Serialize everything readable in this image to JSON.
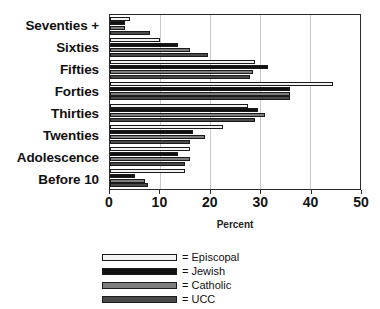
{
  "title_remnant": "",
  "axis": {
    "xlabel": "Percent",
    "ticks": [
      "0",
      "10",
      "20",
      "30",
      "40",
      "50"
    ]
  },
  "legend": {
    "items": [
      {
        "key": "episcopal",
        "label": "= Episcopal"
      },
      {
        "key": "jewish",
        "label": "= Jewish"
      },
      {
        "key": "catholic",
        "label": "= Catholic"
      },
      {
        "key": "ucc",
        "label": "= UCC"
      }
    ]
  },
  "colors": {
    "episcopal": "#f2f2f2",
    "jewish": "#111111",
    "catholic": "#7d7d7d",
    "ucc": "#4a4a4a",
    "axis": "#2b2b2b",
    "grid": "#c9c9c9"
  },
  "categories": [
    "Seventies +",
    "Sixties",
    "Fifties",
    "Forties",
    "Thirties",
    "Twenties",
    "Adolescence",
    "Before 10"
  ],
  "chart_data": {
    "type": "bar",
    "orientation": "horizontal",
    "title": "",
    "xlabel": "Percent",
    "ylabel": "",
    "xlim": [
      0,
      50
    ],
    "xticks": [
      0,
      10,
      20,
      30,
      40,
      50
    ],
    "grid": true,
    "legend_position": "bottom",
    "categories": [
      "Seventies +",
      "Sixties",
      "Fifties",
      "Forties",
      "Thirties",
      "Twenties",
      "Adolescence",
      "Before 10"
    ],
    "series": [
      {
        "name": "Episcopal",
        "color": "#f2f2f2",
        "values": [
          4,
          10,
          29,
          44.5,
          27.5,
          22.5,
          16,
          15
        ]
      },
      {
        "name": "Jewish",
        "color": "#111111",
        "values": [
          3,
          13.5,
          31.5,
          36,
          29.5,
          16.5,
          13.5,
          5
        ]
      },
      {
        "name": "Catholic",
        "color": "#7d7d7d",
        "values": [
          3,
          16,
          28.5,
          36,
          31,
          19,
          16,
          7
        ]
      },
      {
        "name": "UCC",
        "color": "#4a4a4a",
        "values": [
          8,
          19.5,
          28,
          36,
          29,
          16,
          15,
          7.5
        ]
      }
    ]
  }
}
